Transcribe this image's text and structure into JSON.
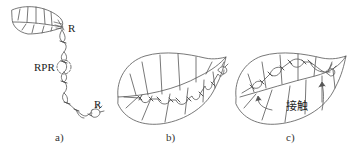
{
  "figure": {
    "panels": [
      {
        "id": "a",
        "caption": "a)",
        "labels": {
          "top_anchor": "R",
          "middle_dashed_circle": "RPR",
          "bottom_anchor": "R"
        },
        "description": "Leaf hanging with a chain of ants/loops extending downward from the leaf tip"
      },
      {
        "id": "b",
        "caption": "b)",
        "description": "Leaf with chain of ants forming loops along the edge"
      },
      {
        "id": "c",
        "caption": "c)",
        "labels": {
          "contact": "接触"
        },
        "description": "Leaf folded with chain; arrows point to contact regions"
      }
    ]
  },
  "colors": {
    "stroke": "#555555",
    "text": "#222222",
    "background": "#ffffff"
  }
}
